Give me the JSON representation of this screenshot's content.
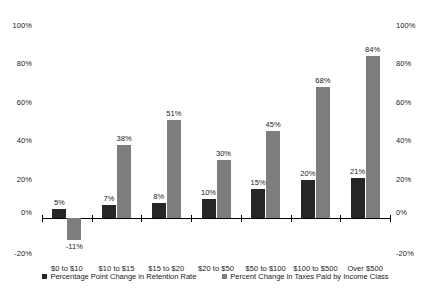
{
  "chart_data": {
    "type": "bar",
    "title": "",
    "subtitle": "",
    "xlabel": "",
    "ylabel": "",
    "ylim": [
      -20,
      100
    ],
    "yticks": [
      "-20%",
      "0%",
      "20%",
      "40%",
      "60%",
      "80%",
      "100%"
    ],
    "ytick_values": [
      -20,
      0,
      20,
      40,
      60,
      80,
      100
    ],
    "grid": false,
    "legend_position": "bottom",
    "dual_axis": true,
    "categories": [
      "$0 to $10",
      "$10 to $15",
      "$15 to $20",
      "$20 to $50",
      "$50 to $100",
      "$100 to $500",
      "Over $500"
    ],
    "series": [
      {
        "name": "Percentage Point Change in Retention Rate",
        "color": "#262626",
        "values": [
          5,
          7,
          8,
          10,
          15,
          20,
          21
        ],
        "labels": [
          "5%",
          "7%",
          "8%",
          "10%",
          "15%",
          "20%",
          "21%"
        ]
      },
      {
        "name": "Percent Change in Taxes Paid by Income Class",
        "color": "#7d7d7d",
        "values": [
          -11,
          38,
          51,
          30,
          45,
          68,
          84
        ],
        "labels": [
          "-11%",
          "38%",
          "51%",
          "30%",
          "45%",
          "68%",
          "84%"
        ]
      }
    ]
  },
  "axes": {
    "left_ticks": [
      "100%",
      "80%",
      "60%",
      "40%",
      "20%",
      "0%",
      "-20%"
    ],
    "right_ticks": [
      "100%",
      "80%",
      "60%",
      "40%",
      "20%",
      "0%",
      "-20%"
    ]
  },
  "legend": {
    "items": [
      {
        "label": "Percentage Point Change in Retention Rate"
      },
      {
        "label": "Percent Change in Taxes Paid by Income Class"
      }
    ]
  }
}
